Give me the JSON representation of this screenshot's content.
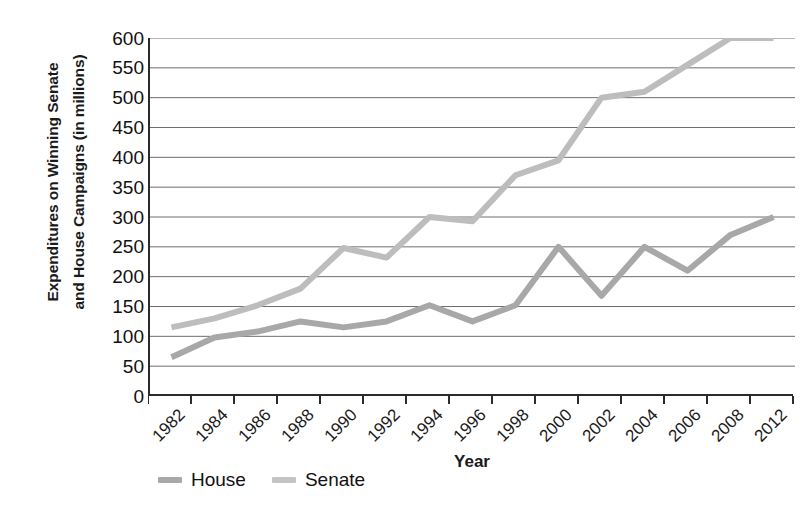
{
  "chart_data": {
    "type": "line",
    "title": "",
    "xlabel": "Year",
    "ylabel": "Expenditures on Winning Senate and House Campaigns (in millions)",
    "ylabel_lines": [
      "Expenditures on Winning Senate",
      "and House Campaigns (in millions)"
    ],
    "categories": [
      "1982",
      "1984",
      "1986",
      "1988",
      "1990",
      "1992",
      "1994",
      "1996",
      "1998",
      "2000",
      "2002",
      "2004",
      "2006",
      "2008",
      "2012"
    ],
    "ylim": [
      0,
      600
    ],
    "ytick_step": 50,
    "yticks": [
      "600",
      "550",
      "500",
      "450",
      "400",
      "350",
      "300",
      "250",
      "200",
      "150",
      "100",
      "50",
      "0"
    ],
    "grid": "horizontal",
    "legend_position": "bottom-left",
    "series": [
      {
        "name": "House",
        "color": "#a8a8a8",
        "values": [
          65,
          98,
          108,
          125,
          115,
          125,
          152,
          125,
          152,
          250,
          168,
          250,
          210,
          270,
          300
        ]
      },
      {
        "name": "Senate",
        "color": "#bdbdbd",
        "values": [
          115,
          130,
          152,
          180,
          248,
          232,
          300,
          293,
          370,
          395,
          500,
          510,
          555,
          600,
          600
        ]
      }
    ]
  },
  "legend": {
    "items": [
      {
        "label": "House",
        "color": "#a8a8a8"
      },
      {
        "label": "Senate",
        "color": "#c4c4c4"
      }
    ]
  },
  "axes": {
    "x_title": "Year",
    "y_title_line1": "Expenditures on Winning Senate",
    "y_title_line2": "and House Campaigns (in millions)"
  },
  "colors": {
    "axis": "#2b2b2b",
    "grid": "#6e6e6e",
    "house": "#a8a8a8",
    "senate": "#c4c4c4",
    "background": "#ffffff"
  }
}
